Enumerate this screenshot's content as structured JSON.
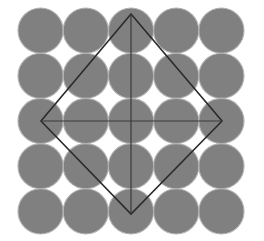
{
  "figure": {
    "type": "geometric-diagram",
    "canvas": {
      "width": 264,
      "height": 241,
      "background": "#ffffff"
    },
    "colors": {
      "circle_fill": "#808080",
      "circle_stroke": "#b3b3b3",
      "square_stroke": "#2b2b2b",
      "diagonal_stroke": "#3a3a3a",
      "background": "#ffffff"
    },
    "square": {
      "label": "rotated square (diamond)",
      "center": {
        "x": 131,
        "y": 121
      },
      "top_vertex": {
        "x": 131,
        "y": 14
      },
      "right_vertex": {
        "x": 222,
        "y": 121
      },
      "bottom_vertex": {
        "x": 131,
        "y": 214
      },
      "left_vertex": {
        "x": 41,
        "y": 121
      },
      "half_diagonal_x": 90.5,
      "half_diagonal_y": 100,
      "stroke_width": 1.6
    },
    "diagonals": {
      "label": "square diagonals",
      "vertical": {
        "x1": 131,
        "y1": 14,
        "x2": 131,
        "y2": 214
      },
      "horizontal": {
        "x1": 41,
        "y1": 121,
        "x2": 222,
        "y2": 121
      },
      "stroke_width": 1.2
    },
    "lattice": {
      "label": "tangent circle packing",
      "radius": 22.6,
      "spacing": 45.2,
      "center": {
        "x": 131,
        "y": 121
      },
      "stroke_width": 1.1,
      "columns": [
        -2,
        -1,
        0,
        1,
        2
      ],
      "rows": [
        -2,
        -1,
        0,
        1,
        2
      ],
      "circle_count": 25,
      "circles": [
        {
          "cx": 131,
          "cy": 121,
          "r": 22.6
        },
        {
          "cx": 85.8,
          "cy": 121,
          "r": 22.6
        },
        {
          "cx": 176.2,
          "cy": 121,
          "r": 22.6
        },
        {
          "cx": 40.6,
          "cy": 121,
          "r": 22.6
        },
        {
          "cx": 221.4,
          "cy": 121,
          "r": 22.6
        },
        {
          "cx": 131,
          "cy": 75.8,
          "r": 22.6
        },
        {
          "cx": 131,
          "cy": 166.2,
          "r": 22.6
        },
        {
          "cx": 131,
          "cy": 30.6,
          "r": 22.6
        },
        {
          "cx": 131,
          "cy": 211.4,
          "r": 22.6
        },
        {
          "cx": 85.8,
          "cy": 75.8,
          "r": 22.6
        },
        {
          "cx": 176.2,
          "cy": 75.8,
          "r": 22.6
        },
        {
          "cx": 85.8,
          "cy": 166.2,
          "r": 22.6
        },
        {
          "cx": 176.2,
          "cy": 166.2,
          "r": 22.6
        },
        {
          "cx": 40.6,
          "cy": 75.8,
          "r": 22.6
        },
        {
          "cx": 221.4,
          "cy": 75.8,
          "r": 22.6
        },
        {
          "cx": 40.6,
          "cy": 166.2,
          "r": 22.6
        },
        {
          "cx": 221.4,
          "cy": 166.2,
          "r": 22.6
        },
        {
          "cx": 85.8,
          "cy": 30.6,
          "r": 22.6
        },
        {
          "cx": 176.2,
          "cy": 30.6,
          "r": 22.6
        },
        {
          "cx": 85.8,
          "cy": 211.4,
          "r": 22.6
        },
        {
          "cx": 176.2,
          "cy": 211.4,
          "r": 22.6
        },
        {
          "cx": 40.6,
          "cy": 30.6,
          "r": 22.6
        },
        {
          "cx": 221.4,
          "cy": 30.6,
          "r": 22.6
        },
        {
          "cx": 40.6,
          "cy": 211.4,
          "r": 22.6
        },
        {
          "cx": 221.4,
          "cy": 211.4,
          "r": 22.6
        }
      ]
    }
  }
}
